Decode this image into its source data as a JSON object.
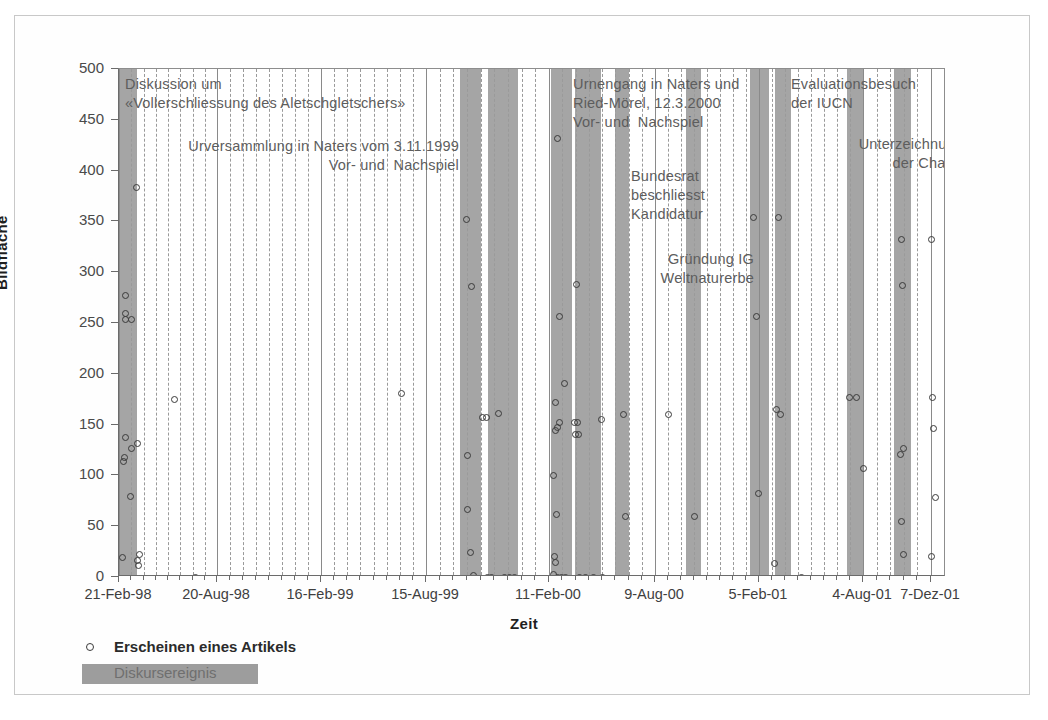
{
  "chart_data": {
    "type": "scatter",
    "title": "",
    "xlabel": "Zeit",
    "ylabel": "Bildfläche",
    "ylim": [
      0,
      500
    ],
    "ytick_values": [
      0,
      50,
      100,
      150,
      200,
      250,
      300,
      350,
      400,
      450,
      500
    ],
    "ytick_labels": [
      "0",
      "50",
      "100",
      "150",
      "200",
      "250",
      "300",
      "350",
      "400",
      "450",
      "500"
    ],
    "xtick_labels": [
      "21-Feb-98",
      "20-Aug-98",
      "16-Feb-99",
      "15-Aug-99",
      "11-Feb-00",
      "9-Aug-00",
      "5-Feb-01",
      "4-Aug-01",
      "7-Dez-01"
    ],
    "xtick_positions_px": [
      118,
      216,
      320,
      425,
      548,
      654,
      758,
      862,
      930
    ],
    "grid": "vertical-dashed-minor-and-solid-major",
    "legend_position": "below-axis-left",
    "series": [
      {
        "name": "Erscheinen eines Artikels",
        "marker": "open-circle",
        "points": [
          {
            "x": 124,
            "y": 277
          },
          {
            "x": 124,
            "y": 259
          },
          {
            "x": 124,
            "y": 253
          },
          {
            "x": 130,
            "y": 253
          },
          {
            "x": 124,
            "y": 137
          },
          {
            "x": 130,
            "y": 126
          },
          {
            "x": 123,
            "y": 118
          },
          {
            "x": 122,
            "y": 114
          },
          {
            "x": 129,
            "y": 79
          },
          {
            "x": 121,
            "y": 19
          },
          {
            "x": 135,
            "y": 383
          },
          {
            "x": 136,
            "y": 131
          },
          {
            "x": 136,
            "y": 16
          },
          {
            "x": 137,
            "y": 11
          },
          {
            "x": 138,
            "y": 22
          },
          {
            "x": 173,
            "y": 175
          },
          {
            "x": 194,
            "y": 0
          },
          {
            "x": 400,
            "y": 181
          },
          {
            "x": 465,
            "y": 352
          },
          {
            "x": 470,
            "y": 286
          },
          {
            "x": 466,
            "y": 120
          },
          {
            "x": 466,
            "y": 66
          },
          {
            "x": 469,
            "y": 24
          },
          {
            "x": 472,
            "y": 1
          },
          {
            "x": 481,
            "y": 157
          },
          {
            "x": 485,
            "y": 157
          },
          {
            "x": 486,
            "y": 0
          },
          {
            "x": 490,
            "y": 0
          },
          {
            "x": 497,
            "y": 161
          },
          {
            "x": 503,
            "y": 0
          },
          {
            "x": 508,
            "y": 0
          },
          {
            "x": 513,
            "y": 0
          },
          {
            "x": 556,
            "y": 432
          },
          {
            "x": 558,
            "y": 256
          },
          {
            "x": 563,
            "y": 190
          },
          {
            "x": 554,
            "y": 172
          },
          {
            "x": 558,
            "y": 152
          },
          {
            "x": 556,
            "y": 147
          },
          {
            "x": 554,
            "y": 144
          },
          {
            "x": 552,
            "y": 100
          },
          {
            "x": 555,
            "y": 62
          },
          {
            "x": 553,
            "y": 20
          },
          {
            "x": 554,
            "y": 14
          },
          {
            "x": 552,
            "y": 2
          },
          {
            "x": 556,
            "y": 0
          },
          {
            "x": 560,
            "y": 0
          },
          {
            "x": 564,
            "y": 0
          },
          {
            "x": 575,
            "y": 288
          },
          {
            "x": 573,
            "y": 152
          },
          {
            "x": 576,
            "y": 152
          },
          {
            "x": 574,
            "y": 140
          },
          {
            "x": 577,
            "y": 140
          },
          {
            "x": 578,
            "y": 0
          },
          {
            "x": 584,
            "y": 0
          },
          {
            "x": 592,
            "y": 0
          },
          {
            "x": 600,
            "y": 155
          },
          {
            "x": 601,
            "y": 0
          },
          {
            "x": 622,
            "y": 160
          },
          {
            "x": 624,
            "y": 60
          },
          {
            "x": 667,
            "y": 160
          },
          {
            "x": 693,
            "y": 60
          },
          {
            "x": 752,
            "y": 354
          },
          {
            "x": 755,
            "y": 256
          },
          {
            "x": 757,
            "y": 82
          },
          {
            "x": 777,
            "y": 354
          },
          {
            "x": 775,
            "y": 165
          },
          {
            "x": 779,
            "y": 160
          },
          {
            "x": 773,
            "y": 13
          },
          {
            "x": 800,
            "y": 0
          },
          {
            "x": 848,
            "y": 177
          },
          {
            "x": 855,
            "y": 177
          },
          {
            "x": 862,
            "y": 107
          },
          {
            "x": 900,
            "y": 332
          },
          {
            "x": 901,
            "y": 287
          },
          {
            "x": 902,
            "y": 126
          },
          {
            "x": 899,
            "y": 121
          },
          {
            "x": 900,
            "y": 55
          },
          {
            "x": 902,
            "y": 22
          },
          {
            "x": 930,
            "y": 332
          },
          {
            "x": 931,
            "y": 177
          },
          {
            "x": 932,
            "y": 146
          },
          {
            "x": 934,
            "y": 78
          },
          {
            "x": 930,
            "y": 20
          }
        ]
      }
    ],
    "bands": {
      "name": "Diskursereignis",
      "color": "#9d9d9d",
      "ranges_px": [
        [
          118,
          136
        ],
        [
          459,
          480
        ],
        [
          487,
          517
        ],
        [
          550,
          571
        ],
        [
          574,
          600
        ],
        [
          614,
          628
        ],
        [
          685,
          700
        ],
        [
          749,
          768
        ],
        [
          774,
          790
        ],
        [
          846,
          862
        ],
        [
          893,
          910
        ]
      ]
    },
    "annotations": [
      {
        "id": "annot-diskussion",
        "text": "Diskussion um\n«Vollerschliessung des Aletschgletschers»",
        "x_px": 124,
        "y_px": 74,
        "align": "left"
      },
      {
        "id": "annot-urversammlung",
        "text": "Urversammlung in Naters vom 3.11.1999\nVor- und  Nachspiel",
        "x_px": 460,
        "y_px": 136,
        "align": "right"
      },
      {
        "id": "annot-urnengang",
        "text": "Urnengang in Naters und\nRied-Mörel, 12.3.2000\nVor- und  Nachspiel",
        "x_px": 572,
        "y_px": 74,
        "align": "left"
      },
      {
        "id": "annot-bundesrat",
        "text": "Bundesrat\nbeschliesst\nKandidatur",
        "x_px": 630,
        "y_px": 166,
        "align": "left"
      },
      {
        "id": "annot-gruendung",
        "text": "Gründung IG\nWeltnaturerbe",
        "x_px": 755,
        "y_px": 249,
        "align": "right"
      },
      {
        "id": "annot-evaluation",
        "text": "Evaluationsbesuch\nder IUCN",
        "x_px": 790,
        "y_px": 74,
        "align": "left"
      },
      {
        "id": "annot-unterzeichnung",
        "text": "Unterzeichnung\nder Charta",
        "x_px": 964,
        "y_px": 134,
        "align": "right"
      }
    ]
  },
  "legend": {
    "items": [
      {
        "id": "legend-artikel",
        "label": "Erscheinen eines Artikels",
        "marker": "open-circle"
      },
      {
        "id": "legend-diskursereignis",
        "label": "Diskursereignis",
        "marker": "gray-band"
      }
    ]
  },
  "axes": {
    "y_title": "Bildfläche",
    "x_title": "Zeit"
  }
}
